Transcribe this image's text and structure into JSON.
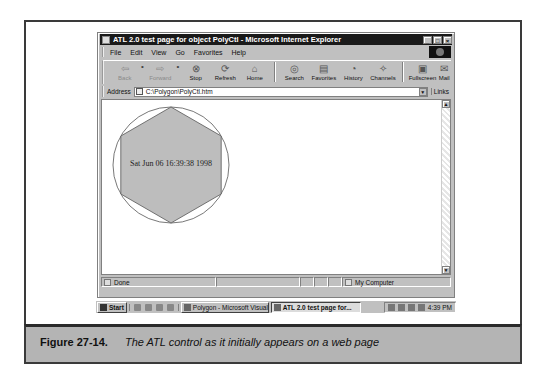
{
  "window": {
    "title": "ATL 2.0 test page for object PolyCtl - Microsoft Internet Explorer",
    "controls": {
      "minimize": "_",
      "maximize": "□",
      "close": "×"
    }
  },
  "menu": [
    "File",
    "Edit",
    "View",
    "Go",
    "Favorites",
    "Help"
  ],
  "toolbar": {
    "buttons": [
      {
        "label": "Back",
        "icon": "back-arrow-icon",
        "glyph": "⇦",
        "disabled": true
      },
      {
        "label": "Forward",
        "icon": "forward-arrow-icon",
        "glyph": "⇨",
        "disabled": true
      },
      {
        "label": "Stop",
        "icon": "stop-icon",
        "glyph": "⊗",
        "disabled": false
      },
      {
        "label": "Refresh",
        "icon": "refresh-icon",
        "glyph": "⟳",
        "disabled": false
      },
      {
        "label": "Home",
        "icon": "home-icon",
        "glyph": "⌂",
        "disabled": false
      },
      {
        "label": "Search",
        "icon": "search-icon",
        "glyph": "◎",
        "disabled": false
      },
      {
        "label": "Favorites",
        "icon": "favorites-icon",
        "glyph": "▤",
        "disabled": false
      },
      {
        "label": "History",
        "icon": "history-icon",
        "glyph": "◔",
        "disabled": false
      },
      {
        "label": "Channels",
        "icon": "channels-icon",
        "glyph": "✧",
        "disabled": false
      },
      {
        "label": "Fullscreen",
        "icon": "fullscreen-icon",
        "glyph": "▣",
        "disabled": false
      },
      {
        "label": "Mail",
        "icon": "mail-icon",
        "glyph": "✉",
        "disabled": false
      }
    ]
  },
  "address": {
    "label": "Address",
    "value": "C:\\Polygon\\PolyCtl.htm",
    "links_label": "Links"
  },
  "content": {
    "polygon_sides": 6,
    "polygon_fill": "#bdbdbd",
    "date_text": "Sat Jun 06 16:39:38 1998"
  },
  "status": {
    "text": "Done",
    "zone": "My Computer"
  },
  "taskbar": {
    "start_label": "Start",
    "tasks": [
      {
        "label": "Polygon - Microsoft Visual ...",
        "active": false
      },
      {
        "label": "ATL 2.0 test page for...",
        "active": true
      }
    ],
    "clock": "4:39 PM"
  },
  "caption": {
    "label": "Figure 27-14.",
    "text": "The ATL control as it initially appears on a web page"
  }
}
